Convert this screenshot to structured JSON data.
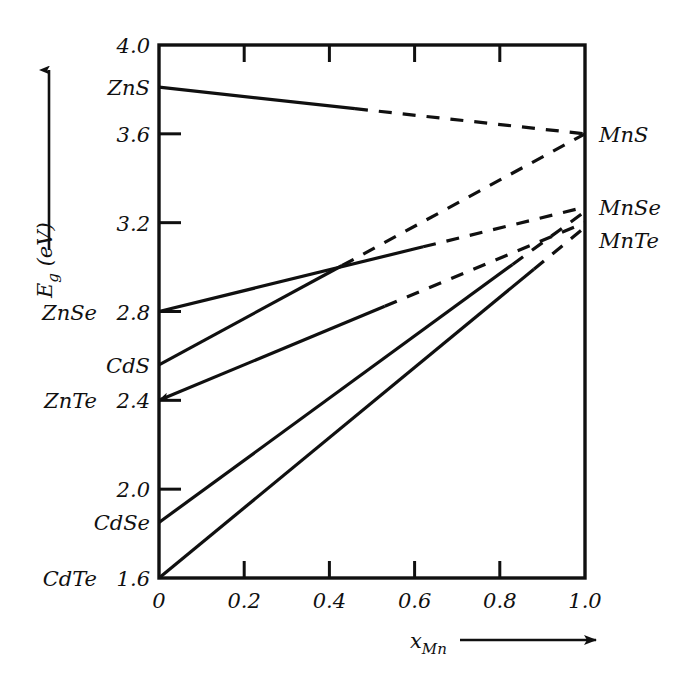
{
  "chart_data": {
    "type": "line",
    "title": "",
    "subtitle": "",
    "xlabel": "x_Mn",
    "xlabel_base": "x",
    "xlabel_sub": "Mn",
    "ylabel": "E_g (eV)",
    "ylabel_base": "E",
    "ylabel_sub": "g",
    "ylabel_unit": "(eV)",
    "xlim": [
      0,
      1.0
    ],
    "ylim": [
      1.6,
      4.0
    ],
    "grid": false,
    "legend": "none",
    "xticks": [
      0,
      0.2,
      0.4,
      0.6,
      0.8,
      1.0
    ],
    "xtick_labels": [
      "0",
      "0.2",
      "0.4",
      "0.6",
      "0.8",
      "1.0"
    ],
    "yticks": [
      1.6,
      2.0,
      2.4,
      2.8,
      3.2,
      3.6,
      4.0
    ],
    "ytick_labels": [
      "1.6",
      "2.0",
      "2.4",
      "2.8",
      "3.2",
      "3.6",
      "4.0"
    ],
    "x_axis_direction_arrow": true,
    "y_axis_direction_arrow": true,
    "series": [
      {
        "name": "ZnS-MnS",
        "left_label": "ZnS",
        "right_label": "MnS",
        "x": [
          0,
          1.0
        ],
        "values": [
          3.81,
          3.6
        ],
        "solid_until_x": 0.46,
        "left_label_y": 3.81,
        "right_label_y": 3.6,
        "left_arrow": false
      },
      {
        "name": "ZnSe-MnSe",
        "left_label": "ZnSe",
        "right_label": "MnSe",
        "x": [
          0,
          1.0
        ],
        "values": [
          2.8,
          3.27
        ],
        "solid_until_x": 0.62,
        "left_label_y": 2.8,
        "right_label_y": 3.27,
        "left_arrow": false
      },
      {
        "name": "CdS-MnS",
        "left_label": "CdS",
        "right_label": "MnS",
        "x": [
          0,
          1.0
        ],
        "values": [
          2.56,
          3.6
        ],
        "solid_until_x": 0.43,
        "left_label_y": 2.56,
        "right_label_y": 3.6,
        "left_arrow": false
      },
      {
        "name": "ZnTe-MnTe",
        "left_label": "ZnTe",
        "right_label": "MnTe",
        "x": [
          0,
          1.0
        ],
        "values": [
          2.4,
          3.2
        ],
        "solid_until_x": 0.53,
        "left_label_y": 2.4,
        "right_label_y": 3.2,
        "left_arrow": true
      },
      {
        "name": "CdSe-MnSe",
        "left_label": "CdSe",
        "right_label": "MnSe",
        "x": [
          0,
          1.0
        ],
        "values": [
          1.85,
          3.25
        ],
        "solid_until_x": 0.83,
        "left_label_y": 1.85,
        "right_label_y": 3.25,
        "left_arrow": false
      },
      {
        "name": "CdTe-MnTe",
        "left_label": "CdTe",
        "right_label": "MnTe",
        "x": [
          0,
          1.0
        ],
        "values": [
          1.6,
          3.18
        ],
        "solid_until_x": 0.88,
        "left_label_y": 1.6,
        "right_label_y": 3.18,
        "left_arrow": false
      }
    ],
    "left_axis_labels": [
      {
        "text": "ZnS",
        "value": 3.81
      },
      {
        "text": "ZnSe",
        "value": 2.8
      },
      {
        "text": "CdS",
        "value": 2.56
      },
      {
        "text": "ZnTe",
        "value": 2.4
      },
      {
        "text": "CdSe",
        "value": 1.85
      },
      {
        "text": "CdTe",
        "value": 1.6
      }
    ],
    "right_axis_labels": [
      {
        "text": "MnS",
        "value": 3.6
      },
      {
        "text": "MnSe",
        "value": 3.27
      },
      {
        "text": "MnTe",
        "value": 3.12
      }
    ],
    "colors": {
      "line": "#101010",
      "axis": "#101010",
      "background": "#ffffff"
    }
  }
}
